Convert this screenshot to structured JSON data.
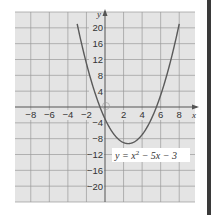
{
  "chart_data": {
    "type": "line",
    "title": "",
    "equation_label": "y = x² − 5x − 3",
    "equation_parts": {
      "lhs": "y = x",
      "sup": "2",
      "rhs": " − 5x − 3"
    },
    "xlabel": "x",
    "ylabel": "y",
    "xlim": [
      -9.7,
      9.7
    ],
    "ylim": [
      -24,
      24
    ],
    "x_ticks": [
      -8,
      -6,
      -4,
      -2,
      2,
      4,
      6,
      8
    ],
    "x_tick_labels": [
      "−8",
      "−6",
      "−4",
      "−2",
      "2",
      "4",
      "6",
      "8"
    ],
    "y_ticks": [
      20,
      16,
      12,
      8,
      4,
      -4,
      -8,
      -12,
      -16,
      -20
    ],
    "y_tick_labels": [
      "20",
      "16",
      "12",
      "8",
      "4",
      "−4",
      "−8",
      "−12",
      "−16",
      "−20"
    ],
    "grid": true,
    "grid_x_step": 2,
    "grid_y_step": 4,
    "series": [
      {
        "name": "y = x^2 - 5x - 3",
        "coefficients": {
          "a": 1,
          "b": -5,
          "c": -3
        },
        "x_range": [
          -3,
          8
        ],
        "x": [
          -3,
          -2,
          -1,
          0,
          1,
          2,
          2.5,
          3,
          4,
          5,
          6,
          7,
          8
        ],
        "y": [
          21,
          11,
          3,
          -3,
          -7,
          -9,
          -9.25,
          -9,
          -7,
          -3,
          3,
          11,
          21
        ],
        "vertex": [
          2.5,
          -9.25
        ],
        "roots": [
          -0.54,
          5.54
        ]
      }
    ]
  },
  "colors": {
    "grid_bg": "#e4e4e4",
    "grid_line": "#9a9a9a",
    "axis": "#555555",
    "curve": "#5a5a5a",
    "label_text": "#333333",
    "label_box": "#ffffff",
    "side_bar": "#3a3a3a"
  }
}
